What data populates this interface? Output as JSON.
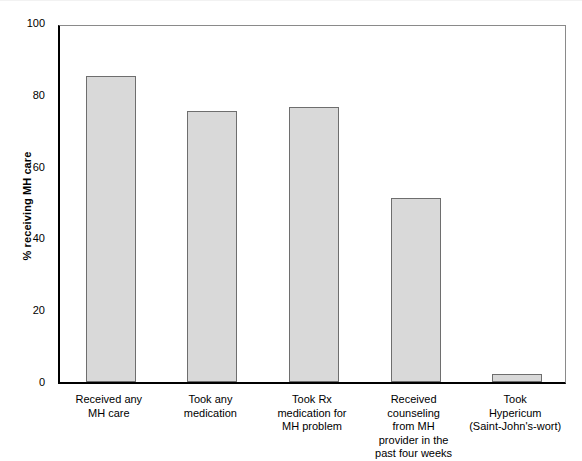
{
  "chart_data": {
    "type": "bar",
    "title": "",
    "xlabel": "",
    "ylabel": "% receiving MH care",
    "ylim": [
      0,
      100
    ],
    "yticks": [
      0,
      20,
      40,
      60,
      80,
      100
    ],
    "grid": false,
    "legend": "none",
    "categories": [
      "Received any\nMH care",
      "Took any\nmedication",
      "Took Rx\nmedication for\nMH problem",
      "Received\ncounseling\nfrom MH\nprovider in the\npast four weeks",
      "Took\nHypericum\n(Saint-John's-wort)"
    ],
    "values": [
      85.3,
      75.5,
      76.6,
      51.3,
      2.3
    ],
    "bar_fill_color": "#d9d9d9",
    "bar_border_color": "#6e6e6e",
    "axis_color": "#000000"
  },
  "axis": {
    "y_title": "% receiving MH care",
    "y_tick_labels": [
      "100",
      "80",
      "60",
      "40",
      "20",
      "0"
    ]
  }
}
